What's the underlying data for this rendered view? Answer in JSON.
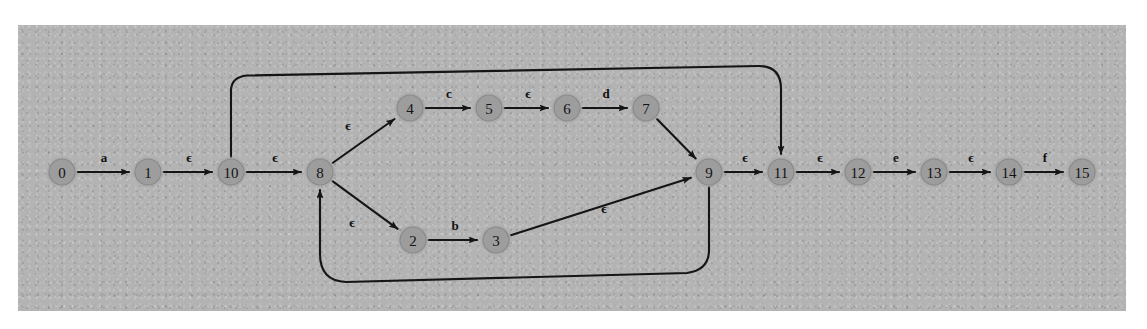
{
  "figure": {
    "kind": "nfa-transition-diagram",
    "panel": {
      "x": 18,
      "y": 25,
      "width": 1108,
      "height": 286,
      "background_color": "#b3b3b3"
    },
    "node_style": {
      "fill_color": "#9d9d9d",
      "stroke_color": "#8a8a8a",
      "radius": 13,
      "label_color": "#141414"
    },
    "edge_style": {
      "stroke_color": "#151515",
      "stroke_width": 2.1,
      "label_color": "#101010"
    },
    "epsilon_symbol": "ϵ"
  },
  "nodes": [
    {
      "id": "0",
      "label": "0",
      "x": 62,
      "y": 172
    },
    {
      "id": "1",
      "label": "1",
      "x": 148,
      "y": 172
    },
    {
      "id": "10",
      "label": "10",
      "x": 231,
      "y": 172
    },
    {
      "id": "8",
      "label": "8",
      "x": 320,
      "y": 172
    },
    {
      "id": "4",
      "label": "4",
      "x": 410,
      "y": 108
    },
    {
      "id": "5",
      "label": "5",
      "x": 489,
      "y": 108
    },
    {
      "id": "6",
      "label": "6",
      "x": 567,
      "y": 108
    },
    {
      "id": "7",
      "label": "7",
      "x": 646,
      "y": 108
    },
    {
      "id": "2",
      "label": "2",
      "x": 413,
      "y": 240
    },
    {
      "id": "3",
      "label": "3",
      "x": 496,
      "y": 240
    },
    {
      "id": "9",
      "label": "9",
      "x": 709,
      "y": 172
    },
    {
      "id": "11",
      "label": "11",
      "x": 781,
      "y": 172
    },
    {
      "id": "12",
      "label": "12",
      "x": 858,
      "y": 172
    },
    {
      "id": "13",
      "label": "13",
      "x": 934,
      "y": 172
    },
    {
      "id": "14",
      "label": "14",
      "x": 1009,
      "y": 172
    },
    {
      "id": "15",
      "label": "15",
      "x": 1082,
      "y": 172
    }
  ],
  "edges": [
    {
      "from": "0",
      "to": "1",
      "label": "a",
      "shape": "straight",
      "label_x": 104,
      "label_y": 157
    },
    {
      "from": "1",
      "to": "10",
      "label": "ϵ",
      "shape": "straight",
      "label_x": 189,
      "label_y": 157
    },
    {
      "from": "10",
      "to": "8",
      "label": "ϵ",
      "shape": "straight",
      "label_x": 275,
      "label_y": 157
    },
    {
      "from": "8",
      "to": "4",
      "label": "ϵ",
      "shape": "straight",
      "label_x": 348,
      "label_y": 125
    },
    {
      "from": "4",
      "to": "5",
      "label": "c",
      "shape": "straight",
      "label_x": 449,
      "label_y": 93
    },
    {
      "from": "5",
      "to": "6",
      "label": "ϵ",
      "shape": "straight",
      "label_x": 528,
      "label_y": 93
    },
    {
      "from": "6",
      "to": "7",
      "label": "d",
      "shape": "straight",
      "label_x": 606,
      "label_y": 93
    },
    {
      "from": "7",
      "to": "9",
      "label": "",
      "shape": "straight",
      "label_x": 0,
      "label_y": 0
    },
    {
      "from": "8",
      "to": "2",
      "label": "ϵ",
      "shape": "straight",
      "label_x": 352,
      "label_y": 222
    },
    {
      "from": "2",
      "to": "3",
      "label": "b",
      "shape": "straight",
      "label_x": 455,
      "label_y": 225
    },
    {
      "from": "3",
      "to": "9",
      "label": "ϵ",
      "shape": "straight",
      "label_x": 604,
      "label_y": 208
    },
    {
      "from": "9",
      "to": "11",
      "label": "ϵ",
      "shape": "straight",
      "label_x": 745,
      "label_y": 157
    },
    {
      "from": "11",
      "to": "12",
      "label": "ϵ",
      "shape": "straight",
      "label_x": 820,
      "label_y": 157
    },
    {
      "from": "12",
      "to": "13",
      "label": "e",
      "shape": "straight",
      "label_x": 896,
      "label_y": 157
    },
    {
      "from": "13",
      "to": "14",
      "label": "ϵ",
      "shape": "straight",
      "label_x": 971,
      "label_y": 157
    },
    {
      "from": "14",
      "to": "15",
      "label": "f",
      "shape": "straight",
      "label_x": 1045,
      "label_y": 157
    },
    {
      "from": "10",
      "to": "11",
      "label": "",
      "shape": "top-loop",
      "label_x": 0,
      "label_y": 0
    },
    {
      "from": "9",
      "to": "8",
      "label": "",
      "shape": "bottom-loop",
      "label_x": 0,
      "label_y": 0
    }
  ]
}
